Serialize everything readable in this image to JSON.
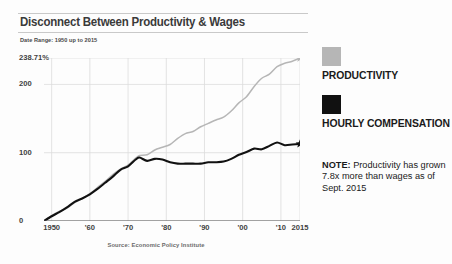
{
  "chart_title": "Disconnect Between Productivity & Wages",
  "date_range": "Date Range: 1950 up to 2015",
  "source": "Source: Economic Policy Institute",
  "legend": {
    "productivity_label": "PRODUCTIVITY",
    "wages_label": "HOURLY COMPENSATION",
    "productivity_color": "#b6b6b6",
    "wages_color": "#111111",
    "note_prefix": "NOTE:",
    "note_text": " Productivity has grown 7.8x more than wages as of Sept. 2015"
  },
  "chart_data": {
    "type": "line",
    "title": "Disconnect Between Productivity & Wages",
    "subtitle": "Date Range: 1950 up to 2015",
    "xlabel": "",
    "ylabel": "",
    "xlim": [
      1948,
      2015
    ],
    "ylim": [
      0,
      238.71
    ],
    "grid": true,
    "legend_position": "right",
    "y_ticks": [
      0,
      100,
      200,
      238.71
    ],
    "y_tick_labels": [
      "0",
      "100",
      "200",
      "238.71%"
    ],
    "x_ticks": [
      1950,
      1960,
      1970,
      1980,
      1990,
      2000,
      2010,
      2015
    ],
    "x_tick_labels": [
      "1950",
      "'60",
      "'70",
      "'80",
      "'90",
      "'00",
      "'10",
      "2015"
    ],
    "annotations": [
      "NOTE: Productivity has grown 7.8x more than wages as of Sept. 2015"
    ],
    "source": "Source: Economic Policy Institute",
    "endpoint_markers": "star",
    "series": [
      {
        "name": "PRODUCTIVITY",
        "color": "#b6b6b6",
        "x": [
          1948,
          1950,
          1952,
          1954,
          1956,
          1958,
          1960,
          1962,
          1964,
          1966,
          1968,
          1970,
          1972,
          1973,
          1975,
          1977,
          1979,
          1981,
          1983,
          1985,
          1987,
          1989,
          1991,
          1993,
          1995,
          1997,
          1999,
          2001,
          2003,
          2005,
          2007,
          2009,
          2011,
          2013,
          2015
        ],
        "values": [
          0,
          8,
          14,
          19,
          27,
          33,
          40,
          49,
          58,
          68,
          76,
          82,
          92,
          96,
          97,
          104,
          108,
          112,
          121,
          128,
          131,
          138,
          143,
          148,
          152,
          161,
          173,
          182,
          197,
          209,
          215,
          226,
          231,
          234,
          238.71
        ]
      },
      {
        "name": "HOURLY COMPENSATION",
        "color": "#111111",
        "x": [
          1948,
          1950,
          1952,
          1954,
          1956,
          1958,
          1960,
          1962,
          1964,
          1966,
          1968,
          1970,
          1972,
          1973,
          1975,
          1977,
          1979,
          1981,
          1983,
          1985,
          1987,
          1989,
          1991,
          1993,
          1995,
          1997,
          1999,
          2001,
          2003,
          2005,
          2007,
          2009,
          2011,
          2013,
          2015
        ],
        "values": [
          0,
          7,
          13,
          20,
          28,
          33,
          39,
          47,
          56,
          65,
          75,
          80,
          90,
          93,
          88,
          91,
          90,
          86,
          84,
          84,
          84,
          84,
          86,
          86,
          87,
          91,
          97,
          101,
          106,
          105,
          110,
          115,
          111,
          112,
          113
        ]
      }
    ]
  }
}
